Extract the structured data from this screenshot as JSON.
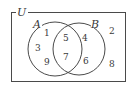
{
  "diagram": {
    "type": "venn",
    "universe": {
      "label": "U",
      "outside_elements": [
        "2",
        "8"
      ]
    },
    "sets": [
      {
        "name": "A",
        "label": "A",
        "only_elements": [
          "1",
          "3",
          "9"
        ]
      },
      {
        "name": "B",
        "label": "B",
        "only_elements": [
          "4",
          "6"
        ]
      }
    ],
    "intersection": {
      "sets": [
        "A",
        "B"
      ],
      "elements": [
        "5",
        "7"
      ]
    },
    "colors": {
      "stroke": "#4a4a4a",
      "text": "#3a3a3a",
      "background": "#ffffff"
    }
  }
}
